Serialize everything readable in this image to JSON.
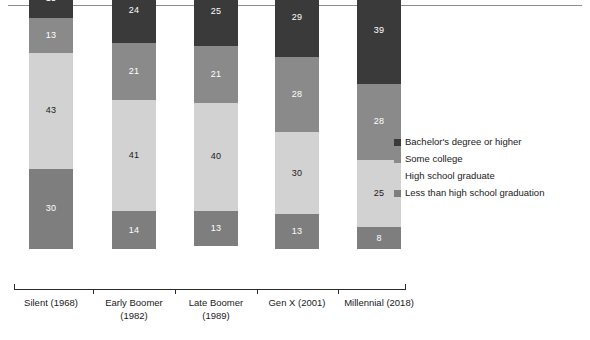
{
  "chart_data": {
    "type": "bar",
    "subtype": "stacked-bar-100-percent",
    "title": "",
    "subtitle": "",
    "xlabel": "",
    "ylabel": "",
    "ylim": [
      0,
      100
    ],
    "grid": false,
    "legend_position": "right",
    "orientation": "vertical",
    "stack_order_bottom_to_top": [
      "Less than high school graduation",
      "High school graduate",
      "Some college",
      "Bachelor's degree or higher"
    ],
    "categories": [
      "Silent (1968)",
      "Early Boomer (1982)",
      "Late Boomer (1989)",
      "Gen X (2001)",
      "Millennial (2018)"
    ],
    "category_lines": [
      [
        "Silent (1968)"
      ],
      [
        "Early Boomer",
        "(1982)"
      ],
      [
        "Late Boomer",
        "(1989)"
      ],
      [
        "Gen X (2001)"
      ],
      [
        "Millennial (2018)"
      ]
    ],
    "series": [
      {
        "name": "Bachelor's degree or higher",
        "color": "#3a3a3a",
        "label_color": "#ffffff",
        "values": [
          15,
          24,
          25,
          29,
          39
        ]
      },
      {
        "name": "Some college",
        "color": "#8a8a8a",
        "label_color": "#ffffff",
        "values": [
          13,
          21,
          21,
          28,
          28
        ]
      },
      {
        "name": "High school graduate",
        "color": "#d2d2d2",
        "label_color": "#1a1a1a",
        "values": [
          43,
          41,
          40,
          30,
          25
        ]
      },
      {
        "name": "Less than high school graduation",
        "color": "#7e7e7e",
        "label_color": "#ffffff",
        "values": [
          30,
          14,
          13,
          13,
          8
        ]
      }
    ]
  },
  "legend": {
    "items": [
      {
        "label": "Bachelor's degree or higher",
        "color": "#3a3a3a"
      },
      {
        "label": "Some college",
        "color": "#8a8a8a"
      },
      {
        "label": "High school graduate",
        "color": "#d2d2d2"
      },
      {
        "label": "Less than high school graduation",
        "color": "#7e7e7e"
      }
    ]
  },
  "axis": {
    "tick_count": 6
  }
}
